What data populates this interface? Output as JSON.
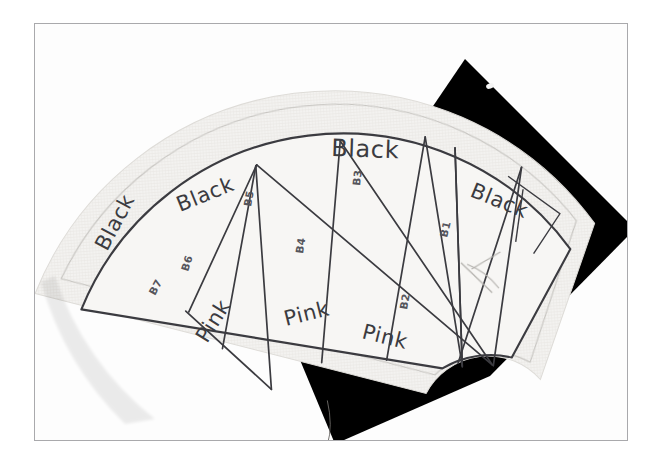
{
  "photo": {
    "subject": "hand-drawn fan quilt block pattern on fabric",
    "frame_color": "#a9a9ac",
    "background_color": "#ffffff",
    "fabric_color": "#f2f1ef",
    "ink_color": "#3b3b40",
    "shadow_color": "#000000"
  },
  "pattern": {
    "title": "fan-block-pattern",
    "wedge_count": 7,
    "wedges": [
      {
        "code": "B7",
        "fabric": "Black",
        "code_x": 145,
        "code_y": 238,
        "code_rot": -62,
        "word_x": 108,
        "word_y": 210,
        "word_rot": -62
      },
      {
        "code": "B6",
        "fabric": "Pink",
        "code_x": 176,
        "code_y": 225,
        "code_rot": -70,
        "word_x": 207,
        "word_y": 308,
        "word_rot": -55
      },
      {
        "code": "B5",
        "fabric": "Black",
        "code_x": 244,
        "code_y": 174,
        "code_rot": -78,
        "word_x": 180,
        "word_y": 172,
        "word_rot": -20
      },
      {
        "code": "B4",
        "fabric": "Pink",
        "code_x": 302,
        "code_y": 217,
        "code_rot": -82,
        "word_x": 291,
        "word_y": 293,
        "word_rot": -13
      },
      {
        "code": "B3",
        "fabric": "Black",
        "code_x": 360,
        "code_y": 152,
        "code_rot": -84,
        "word_x": 336,
        "word_y": 122,
        "word_rot": 3
      },
      {
        "code": "B2",
        "fabric": "Pink",
        "code_x": 406,
        "code_y": 273,
        "code_rot": -80,
        "word_x": 366,
        "word_y": 305,
        "word_rot": 12
      },
      {
        "code": "B1",
        "fabric": "Black",
        "code_x": 447,
        "code_y": 196,
        "code_rot": -78,
        "word_x": 468,
        "word_y": 170,
        "word_rot": 20
      }
    ],
    "labels": {
      "black": "Black",
      "pink": "Pink"
    }
  },
  "geometry": {
    "center_x": 318,
    "center_y": 392,
    "outer_radius": 300,
    "inner_radius": 96,
    "seam_outer_radius": 322,
    "seam_inner_radius": 70,
    "start_angle_deg": -168,
    "end_angle_deg": -12,
    "spoke_angles_deg": [
      -168,
      -151,
      -129,
      -110,
      -90,
      -70,
      -48,
      -30,
      -12
    ]
  }
}
